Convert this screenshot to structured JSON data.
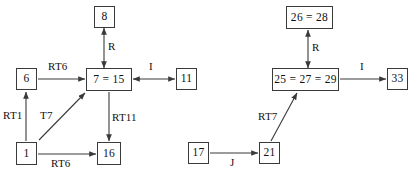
{
  "diagram": {
    "type": "directed-graph",
    "title": "",
    "background_color": "#ffffff",
    "stroke_color": "#3a3a3a",
    "text_color": "#111111",
    "width": 414,
    "height": 171,
    "nodes": [
      {
        "id": "n8",
        "label": "8",
        "x": 94,
        "y": 6,
        "w": 21,
        "h": 22
      },
      {
        "id": "n6",
        "label": "6",
        "x": 16,
        "y": 68,
        "w": 21,
        "h": 22
      },
      {
        "id": "n7",
        "label": "7 = 15",
        "x": 86,
        "y": 68,
        "w": 46,
        "h": 23
      },
      {
        "id": "n11",
        "label": "11",
        "x": 176,
        "y": 68,
        "w": 21,
        "h": 22
      },
      {
        "id": "n1",
        "label": "1",
        "x": 16,
        "y": 142,
        "w": 21,
        "h": 23
      },
      {
        "id": "n16",
        "label": "16",
        "x": 97,
        "y": 142,
        "w": 24,
        "h": 23
      },
      {
        "id": "n26",
        "label": "26 = 28",
        "x": 286,
        "y": 6,
        "w": 47,
        "h": 23
      },
      {
        "id": "n25",
        "label": "25 = 27 = 29",
        "x": 272,
        "y": 68,
        "w": 67,
        "h": 23
      },
      {
        "id": "n33",
        "label": "33",
        "x": 387,
        "y": 68,
        "w": 21,
        "h": 22
      },
      {
        "id": "n17",
        "label": "17",
        "x": 188,
        "y": 142,
        "w": 21,
        "h": 22
      },
      {
        "id": "n21",
        "label": "21",
        "x": 259,
        "y": 142,
        "w": 21,
        "h": 22
      }
    ],
    "edges": [
      {
        "id": "e1",
        "from": "n7",
        "to": "n8",
        "label": "R",
        "arrow": "double",
        "x1": 104,
        "y1": 68,
        "x2": 104,
        "y2": 28,
        "lx": 108,
        "ly": 41
      },
      {
        "id": "e2",
        "from": "n6",
        "to": "n7",
        "label": "RT6",
        "arrow": "single",
        "x1": 38,
        "y1": 79,
        "x2": 85,
        "y2": 79,
        "lx": 48,
        "ly": 61
      },
      {
        "id": "e3",
        "from": "n11",
        "to": "n7",
        "label": "I",
        "arrow": "double",
        "x1": 175,
        "y1": 79,
        "x2": 133,
        "y2": 79,
        "lx": 149,
        "ly": 61
      },
      {
        "id": "e4",
        "from": "n1",
        "to": "n6",
        "label": "RT1",
        "arrow": "single",
        "x1": 26,
        "y1": 141,
        "x2": 26,
        "y2": 92,
        "lx": 3,
        "ly": 110
      },
      {
        "id": "e5",
        "from": "n1",
        "to": "n7",
        "label": "T7",
        "arrow": "single",
        "x1": 39,
        "y1": 140,
        "x2": 85,
        "y2": 93,
        "lx": 40,
        "ly": 110
      },
      {
        "id": "e6",
        "from": "n7",
        "to": "n16",
        "label": "RT11",
        "arrow": "single",
        "x1": 109,
        "y1": 92,
        "x2": 109,
        "y2": 141,
        "lx": 112,
        "ly": 112
      },
      {
        "id": "e7",
        "from": "n1",
        "to": "n16",
        "label": "RT6",
        "arrow": "single",
        "x1": 38,
        "y1": 154,
        "x2": 96,
        "y2": 154,
        "lx": 51,
        "ly": 158
      },
      {
        "id": "e8",
        "from": "n25",
        "to": "n26",
        "label": "R",
        "arrow": "double",
        "x1": 308,
        "y1": 68,
        "x2": 308,
        "y2": 30,
        "lx": 312,
        "ly": 42
      },
      {
        "id": "e9",
        "from": "n25",
        "to": "n33",
        "label": "I",
        "arrow": "single",
        "x1": 340,
        "y1": 79,
        "x2": 386,
        "y2": 79,
        "lx": 360,
        "ly": 61
      },
      {
        "id": "e10",
        "from": "n21",
        "to": "n25",
        "label": "RT7",
        "arrow": "single",
        "x1": 271,
        "y1": 141,
        "x2": 297,
        "y2": 93,
        "lx": 258,
        "ly": 111
      },
      {
        "id": "e11",
        "from": "n17",
        "to": "n21",
        "label": "J",
        "arrow": "single",
        "x1": 210,
        "y1": 153,
        "x2": 258,
        "y2": 153,
        "lx": 230,
        "ly": 157
      }
    ]
  }
}
